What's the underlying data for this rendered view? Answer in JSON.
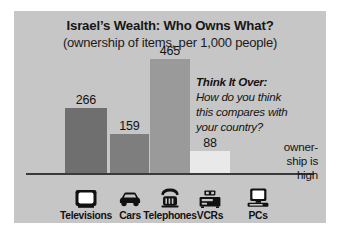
{
  "figure": {
    "title": "Israel’s Wealth: Who Owns What?",
    "subtitle": "(ownership of items, per 1,000 people)",
    "background_color": "#c6c6c6",
    "axis_color": "#3a3a3a"
  },
  "annotation": {
    "heading": "Think It Over:",
    "line1": "How do you think",
    "line2": "this compares with",
    "line3": "your country?"
  },
  "note": {
    "line1": "owner-",
    "line2": "ship is",
    "line3": "high"
  },
  "icons": {
    "televisions": "television-icon",
    "cars": "car-icon",
    "telephones": "telephone-icon",
    "vcrs": "vcr-icon",
    "pcs": "pc-icon"
  },
  "chart_data": {
    "type": "bar",
    "title": "Israel’s Wealth: Who Owns What?",
    "subtitle": "(ownership of items, per 1,000 people)",
    "xlabel": "",
    "ylabel": "ownership of items, per 1,000 people",
    "ylim": [
      0,
      500
    ],
    "grid": false,
    "legend": null,
    "categories": [
      "Televisions",
      "Cars",
      "Telephones",
      "VCRs",
      "PCs"
    ],
    "values": [
      266,
      159,
      465,
      88,
      null
    ],
    "value_labels": [
      "266",
      "159",
      "465",
      "88",
      ""
    ],
    "bar_colors": [
      "#6f6f6f",
      "#7e7e7e",
      "#9a9a9a",
      "#e9e9e9",
      null
    ],
    "annotations": [
      "Think It Over: How do you think this compares with your country?",
      "ownership is high"
    ]
  }
}
